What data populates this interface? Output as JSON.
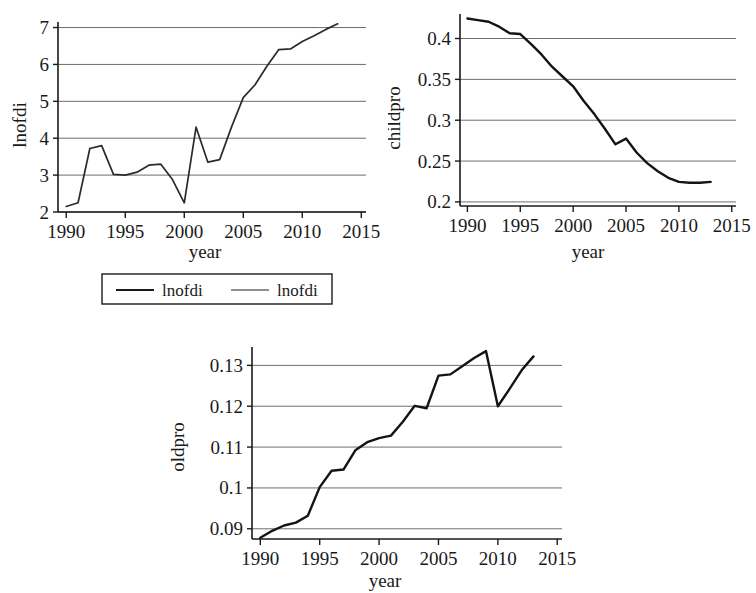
{
  "chart_data": [
    {
      "type": "line",
      "name": "lnofdi-chart",
      "title": "",
      "xlabel": "year",
      "ylabel": "lnofdi",
      "xlim": [
        1989.3,
        2015.4
      ],
      "ylim": [
        2,
        7.15
      ],
      "xticks": [
        1990,
        1995,
        2000,
        2005,
        2010,
        2015
      ],
      "xticklabels": [
        "1990",
        "1995",
        "2000",
        "2005",
        "2010",
        "2015"
      ],
      "yticks": [
        2,
        3,
        4,
        5,
        6,
        7
      ],
      "yticklabels": [
        "2",
        "3",
        "4",
        "5",
        "6",
        "7"
      ],
      "grid": true,
      "legend": {
        "position": "below-left",
        "entries": [
          "lnofdi",
          "lnofdi"
        ]
      },
      "series": [
        {
          "name": "lnofdi",
          "x": [
            1990,
            1991,
            1992,
            1993,
            1994,
            1995,
            1996,
            1997,
            1998,
            1999,
            2000,
            2001,
            2002,
            2003,
            2004,
            2005,
            2006,
            2007,
            2008,
            2009,
            2010,
            2011,
            2012,
            2013
          ],
          "values": [
            2.15,
            2.25,
            3.72,
            3.8,
            3.02,
            3.0,
            3.08,
            3.27,
            3.3,
            2.88,
            2.25,
            4.3,
            3.35,
            3.42,
            4.3,
            5.1,
            5.45,
            5.95,
            6.4,
            6.42,
            6.62,
            6.78,
            6.95,
            7.1
          ]
        }
      ]
    },
    {
      "type": "line",
      "name": "childpro-chart",
      "title": "",
      "xlabel": "year",
      "ylabel": "childpro",
      "xlim": [
        1989.3,
        2015.4
      ],
      "ylim": [
        0.195,
        0.43
      ],
      "xticks": [
        1990,
        1995,
        2000,
        2005,
        2010,
        2015
      ],
      "xticklabels": [
        "1990",
        "1995",
        "2000",
        "2005",
        "2010",
        "2015"
      ],
      "yticks": [
        0.2,
        0.25,
        0.3,
        0.35,
        0.4
      ],
      "yticklabels": [
        "0.2",
        "0.25",
        "0.3",
        "0.35",
        "0.4"
      ],
      "grid": true,
      "series": [
        {
          "name": "childpro",
          "x": [
            1990,
            1991,
            1992,
            1993,
            1994,
            1995,
            1996,
            1997,
            1998,
            1999,
            2000,
            2001,
            2002,
            2003,
            2004,
            2005,
            2006,
            2007,
            2008,
            2009,
            2010,
            2011,
            2012,
            2013
          ],
          "values": [
            0.4245,
            0.4225,
            0.4205,
            0.4145,
            0.4065,
            0.4055,
            0.3935,
            0.3805,
            0.3655,
            0.3535,
            0.3415,
            0.3235,
            0.3075,
            0.2895,
            0.2705,
            0.2775,
            0.2605,
            0.2475,
            0.2375,
            0.2295,
            0.2245,
            0.2235,
            0.2235,
            0.2245
          ]
        }
      ]
    },
    {
      "type": "line",
      "name": "oldpro-chart",
      "title": "",
      "xlabel": "year",
      "ylabel": "oldpro",
      "xlim": [
        1989.3,
        2015.4
      ],
      "ylim": [
        0.0875,
        0.1345
      ],
      "xticks": [
        1990,
        1995,
        2000,
        2005,
        2010,
        2015
      ],
      "xticklabels": [
        "1990",
        "1995",
        "2000",
        "2005",
        "2010",
        "2015"
      ],
      "yticks": [
        0.09,
        0.1,
        0.11,
        0.12,
        0.13
      ],
      "yticklabels": [
        "0.09",
        "0.1",
        "0.11",
        "0.12",
        "0.13"
      ],
      "grid": true,
      "series": [
        {
          "name": "oldpro",
          "x": [
            1990,
            1991,
            1992,
            1993,
            1994,
            1995,
            1996,
            1997,
            1998,
            1999,
            2000,
            2001,
            2002,
            2003,
            2004,
            2005,
            2006,
            2007,
            2008,
            2009,
            2010,
            2011,
            2012,
            2013
          ],
          "values": [
            0.0878,
            0.0895,
            0.0908,
            0.0915,
            0.0932,
            0.1002,
            0.1042,
            0.1045,
            0.1092,
            0.1112,
            0.1122,
            0.1128,
            0.1162,
            0.1201,
            0.1195,
            0.1275,
            0.1278,
            0.1298,
            0.1318,
            0.1335,
            0.12,
            0.1243,
            0.1288,
            0.1322
          ]
        }
      ]
    }
  ]
}
